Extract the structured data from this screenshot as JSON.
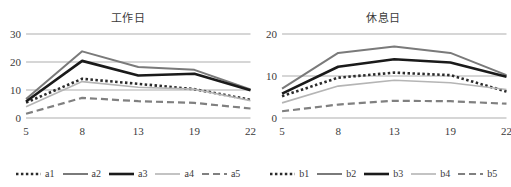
{
  "chart_data": [
    {
      "type": "line",
      "title": "工作日",
      "xlabel": "",
      "ylabel": "",
      "categories": [
        "5",
        "8",
        "13",
        "19",
        "22"
      ],
      "x": [
        5,
        8,
        13,
        19,
        22
      ],
      "ylim": [
        0,
        30
      ],
      "yticks": [
        0,
        10,
        20,
        30
      ],
      "grid": true,
      "legend_position": "bottom",
      "series": [
        {
          "name": "a1",
          "values": [
            5.5,
            14.0,
            12.2,
            10.3,
            6.5
          ],
          "style": "dotted",
          "color": "#2b2b2b",
          "width": 2.6
        },
        {
          "name": "a2",
          "values": [
            6.8,
            23.8,
            18.2,
            17.2,
            10.2
          ],
          "style": "solid",
          "color": "#7a7a7a",
          "width": 2.0
        },
        {
          "name": "a3",
          "values": [
            5.9,
            20.4,
            15.2,
            15.8,
            9.9
          ],
          "style": "solid",
          "color": "#1a1a1a",
          "width": 2.6
        },
        {
          "name": "a4",
          "values": [
            4.0,
            13.0,
            11.0,
            10.3,
            6.2
          ],
          "style": "solid",
          "color": "#b5b5b5",
          "width": 1.6
        },
        {
          "name": "a5",
          "values": [
            1.5,
            7.2,
            6.0,
            5.4,
            3.4
          ],
          "style": "dashed",
          "color": "#808080",
          "width": 2.2
        }
      ]
    },
    {
      "type": "line",
      "title": "休息日",
      "xlabel": "",
      "ylabel": "",
      "categories": [
        "5",
        "8",
        "13",
        "19",
        "22"
      ],
      "x": [
        5,
        8,
        13,
        19,
        22
      ],
      "ylim": [
        0,
        20
      ],
      "yticks": [
        0,
        10,
        20
      ],
      "grid": true,
      "legend_position": "bottom",
      "series": [
        {
          "name": "b1",
          "values": [
            5.2,
            9.6,
            10.8,
            10.2,
            6.3
          ],
          "style": "dotted",
          "color": "#2b2b2b",
          "width": 2.6
        },
        {
          "name": "b2",
          "values": [
            7.0,
            15.5,
            17.0,
            15.5,
            10.2
          ],
          "style": "solid",
          "color": "#7a7a7a",
          "width": 2.0
        },
        {
          "name": "b3",
          "values": [
            5.8,
            12.2,
            14.0,
            13.2,
            9.8
          ],
          "style": "solid",
          "color": "#1a1a1a",
          "width": 2.6
        },
        {
          "name": "b4",
          "values": [
            3.6,
            7.6,
            9.0,
            8.4,
            6.8
          ],
          "style": "solid",
          "color": "#b5b5b5",
          "width": 1.6
        },
        {
          "name": "b5",
          "values": [
            1.6,
            3.2,
            4.1,
            4.0,
            3.4
          ],
          "style": "dashed",
          "color": "#808080",
          "width": 2.2
        }
      ]
    }
  ],
  "panels": [
    {
      "title": "工作日"
    },
    {
      "title": "休息日"
    }
  ]
}
